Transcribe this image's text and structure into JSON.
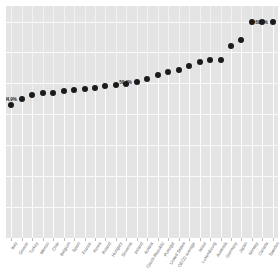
{
  "chart_data": {
    "type": "scatter",
    "title": "",
    "subtitle": "",
    "xlabel": "",
    "ylabel": "",
    "ylim": [
      0,
      75
    ],
    "grid": true,
    "legend": null,
    "plot_background": "#e4e4e4",
    "marker_color": "#1b1b1b",
    "gridline_color": "#fafafa",
    "label_color": "#5d5d5d",
    "categories": [
      "Italy",
      "Greece",
      "Turkey",
      "Mexico",
      "Chile",
      "Belgium",
      "Spain",
      "France",
      "Korea",
      "Poland",
      "Hungary",
      "Slovenia",
      "Ireland",
      "Austria",
      "Czech Republic",
      "Portugal",
      "United States",
      "OECD average",
      "Israel",
      "Luxembourg",
      "Australia",
      "Germany",
      "Japan",
      "Norway",
      "Canada",
      "Sweden"
    ],
    "values": [
      43.1,
      44.9,
      46.4,
      46.9,
      47.0,
      47.4,
      47.9,
      48.3,
      48.6,
      49.0,
      49.4,
      49.8,
      50.4,
      51.4,
      52.6,
      53.7,
      54.3,
      55.6,
      56.9,
      57.4,
      57.6,
      62.1,
      64.1,
      69.9,
      69.9,
      69.9
    ],
    "point_labels": [
      {
        "index": 1,
        "text": "44.9%"
      },
      {
        "index": 12,
        "text": "50.4%"
      },
      {
        "index": 25,
        "text": "69.9%"
      }
    ],
    "yticks": [
      0,
      10,
      20,
      30,
      40,
      50,
      60,
      70
    ]
  }
}
